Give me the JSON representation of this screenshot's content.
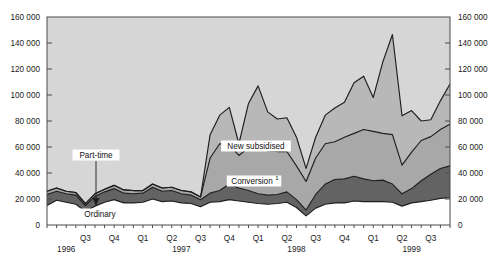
{
  "chart_data": {
    "type": "area",
    "stacked": true,
    "title": "",
    "xlabel": "",
    "ylabel": "",
    "ylim": [
      0,
      160000
    ],
    "ytick_step": 20000,
    "grid": false,
    "legend_position": "inline-annotations",
    "y_ticks_left": [
      "0",
      "20 000",
      "40 000",
      "60 000",
      "80 000",
      "100 000",
      "120 000",
      "140 000",
      "160 000"
    ],
    "y_ticks_right": [
      "0",
      "20 000",
      "40 000",
      "60 000",
      "80 000",
      "100 000",
      "120 000",
      "140 000",
      "160 000"
    ],
    "x_quarter_labels": [
      {
        "label": "Q3",
        "index": 4
      },
      {
        "label": "Q4",
        "index": 7
      },
      {
        "label": "Q1",
        "index": 10
      },
      {
        "label": "Q2",
        "index": 13
      },
      {
        "label": "Q3",
        "index": 16
      },
      {
        "label": "Q4",
        "index": 19
      },
      {
        "label": "Q1",
        "index": 22
      },
      {
        "label": "Q2",
        "index": 25
      },
      {
        "label": "Q3",
        "index": 28
      },
      {
        "label": "Q4",
        "index": 31
      },
      {
        "label": "Q1",
        "index": 34
      },
      {
        "label": "Q2",
        "index": 37
      },
      {
        "label": "Q3",
        "index": 40
      }
    ],
    "x_year_labels": [
      {
        "label": "1996",
        "index": 2
      },
      {
        "label": "1997",
        "index": 14
      },
      {
        "label": "1998",
        "index": 26
      },
      {
        "label": "1999",
        "index": 38
      }
    ],
    "annotations": [
      {
        "name": "part-time",
        "text": "Part-time",
        "has_arrow": true
      },
      {
        "name": "new-subsidised",
        "text": "New subsidised",
        "has_arrow": false
      },
      {
        "name": "conversion",
        "text": "Conversion",
        "footnote": "1",
        "has_arrow": false
      },
      {
        "name": "ordinary",
        "text": "Ordinary",
        "has_arrow": false
      }
    ],
    "series": [
      {
        "name": "Ordinary",
        "color": "#ffffff",
        "values": [
          15000,
          19000,
          17500,
          16000,
          10500,
          14500,
          17500,
          19500,
          17000,
          17000,
          17500,
          20000,
          18000,
          18500,
          17000,
          16500,
          14000,
          17500,
          18000,
          19500,
          18500,
          17500,
          16500,
          16000,
          16500,
          17500,
          13500,
          7000,
          13000,
          16000,
          17000,
          17000,
          18500,
          18000,
          18000,
          18000,
          17500,
          14500,
          17000,
          18000,
          19000,
          20500,
          21000
        ]
      },
      {
        "name": "Part-time",
        "color": "#636363",
        "values": [
          8500,
          7000,
          6500,
          7000,
          4500,
          7500,
          8000,
          8500,
          7500,
          7000,
          7000,
          9000,
          8000,
          8000,
          7000,
          6500,
          5500,
          7000,
          8500,
          12000,
          10000,
          9000,
          7500,
          7000,
          7000,
          8000,
          6000,
          4500,
          10500,
          15500,
          18000,
          18500,
          19000,
          17500,
          16000,
          16500,
          14000,
          9500,
          11000,
          16000,
          20000,
          23000,
          24500
        ]
      },
      {
        "name": "Conversion",
        "color": "#a8a8a8",
        "values": [
          2500,
          2500,
          2000,
          2000,
          1500,
          2000,
          2000,
          2500,
          2500,
          2500,
          2000,
          2500,
          2500,
          2500,
          2500,
          2500,
          2000,
          27000,
          36000,
          30000,
          25000,
          33000,
          38000,
          34000,
          33000,
          31000,
          26000,
          22000,
          28000,
          31000,
          29000,
          32000,
          33000,
          38000,
          38000,
          36000,
          38000,
          22000,
          28000,
          31000,
          29000,
          30000,
          32000
        ]
      },
      {
        "name": "New subsidised",
        "color": "#b8b8b8",
        "values": [
          0,
          0,
          0,
          0,
          0,
          0,
          0,
          0,
          0,
          0,
          0,
          0,
          0,
          0,
          0,
          0,
          0,
          18000,
          22000,
          29000,
          9000,
          34000,
          45000,
          30000,
          25000,
          26000,
          22000,
          10000,
          16000,
          22000,
          26000,
          27000,
          39000,
          41000,
          26000,
          55000,
          77000,
          38000,
          32000,
          15000,
          13000,
          22000,
          31000
        ]
      }
    ],
    "totals_note": "Stacked totals peak near 147 000 in 1999 Q2"
  },
  "colors": {
    "plot_background": "#d6d6d6",
    "ordinary": "#ffffff",
    "part_time": "#636363",
    "conversion": "#a8a8a8",
    "new_subsidised": "#b8b8b8",
    "line": "#1e1e1e",
    "axis": "#4a4a4a",
    "text": "#1a1a1a"
  }
}
